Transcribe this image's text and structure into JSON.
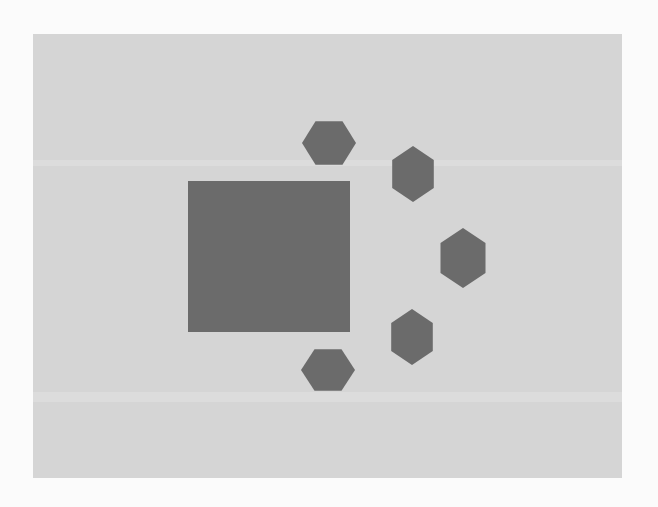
{
  "figure": {
    "background_color": "#fbfbfb",
    "panel_color": "#d5d5d5",
    "shape_color": "#6b6b6b",
    "panel": {
      "x": 33,
      "y": 34,
      "width": 589,
      "height": 444
    },
    "square": {
      "x": 188,
      "y": 181,
      "width": 162,
      "height": 151
    },
    "hexagons": [
      {
        "id": "hex-top",
        "orientation": "flat-top",
        "cx": 329,
        "cy": 143,
        "rx": 27,
        "ry": 25
      },
      {
        "id": "hex-upper-right",
        "orientation": "pointy-top",
        "cx": 413,
        "cy": 174,
        "rx": 24,
        "ry": 28
      },
      {
        "id": "hex-right",
        "orientation": "pointy-top",
        "cx": 463,
        "cy": 258,
        "rx": 26,
        "ry": 30
      },
      {
        "id": "hex-lower-right",
        "orientation": "pointy-top",
        "cx": 412,
        "cy": 337,
        "rx": 24,
        "ry": 28
      },
      {
        "id": "hex-bottom",
        "orientation": "flat-top",
        "cx": 328,
        "cy": 370,
        "rx": 27,
        "ry": 24
      }
    ]
  }
}
